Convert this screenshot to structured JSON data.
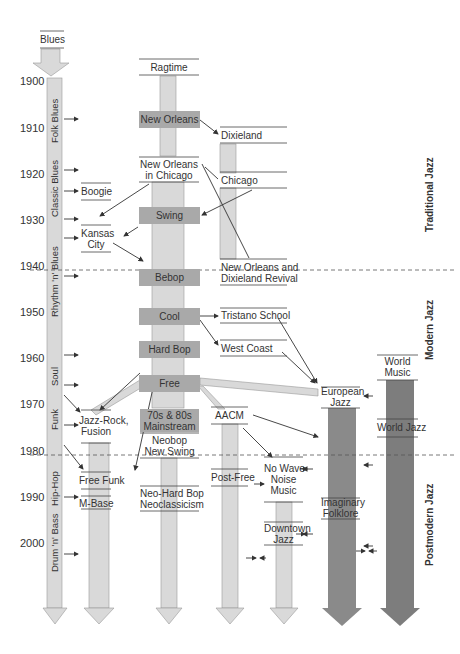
{
  "diagram": {
    "title": "Blues",
    "years": [
      "1900",
      "1910",
      "1920",
      "1930",
      "1940",
      "1950",
      "1960",
      "1970",
      "1980",
      "1990",
      "2000"
    ],
    "blues_column": {
      "header": "Blues",
      "segments": [
        "Folk Blues",
        "Classic Blues",
        "Rhythm 'n' Blues",
        "Soul",
        "Funk",
        "Hip-Hop",
        "Drum 'n' Bass"
      ]
    },
    "eras": [
      "Traditional Jazz",
      "Modern Jazz",
      "Postmodern Jazz"
    ],
    "nodes": {
      "ragtime": "Ragtime",
      "new_orleans": "New Orleans",
      "dixieland": "Dixieland",
      "new_orleans_chicago_1": "New Orleans",
      "new_orleans_chicago_2": "in Chicago",
      "chicago": "Chicago",
      "boogie": "Boogie",
      "swing": "Swing",
      "kansas_city_1": "Kansas",
      "kansas_city_2": "City",
      "bebop": "Bebop",
      "revival_1": "New Orleans and",
      "revival_2": "Dixieland Revival",
      "cool": "Cool",
      "tristano": "Tristano School",
      "hard_bop": "Hard Bop",
      "west_coast": "West Coast",
      "free": "Free",
      "world_music_1": "World",
      "world_music_2": "Music",
      "european_jazz_1": "European",
      "european_jazz_2": "Jazz",
      "jazz_rock_1": "Jazz-Rock,",
      "jazz_rock_2": "Fusion",
      "mainstream_1": "70s & 80s",
      "mainstream_2": "Mainstream",
      "aacm": "AACM",
      "world_jazz": "World Jazz",
      "neobop_1": "Neobop",
      "neobop_2": "New Swing",
      "free_funk": "Free Funk",
      "post_free": "Post-Free",
      "no_wave_1": "No Wave",
      "no_wave_2": "Noise",
      "no_wave_3": "Music",
      "m_base": "M-Base",
      "neo_hard_bop_1": "Neo-Hard Bop",
      "neo_hard_bop_2": "Neoclassicism",
      "imaginary_1": "Imaginary",
      "imaginary_2": "Folklore",
      "downtown_1": "Downtown",
      "downtown_2": "Jazz"
    },
    "colors": {
      "light_column": "#d9d9d9",
      "medium_box": "#a9a9a9",
      "dark_column": "#8a8a8a",
      "darker_column": "#7d7d7d",
      "line": "#333333"
    }
  }
}
